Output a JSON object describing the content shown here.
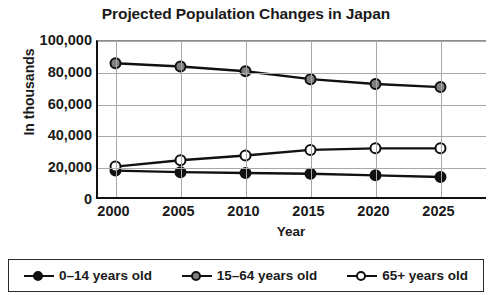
{
  "chart_data": {
    "type": "line",
    "title": "Projected Population Changes in Japan",
    "xlabel": "Year",
    "ylabel": "In thousands",
    "categories": [
      "2000",
      "2005",
      "2010",
      "2015",
      "2020",
      "2025"
    ],
    "x": [
      2000,
      2005,
      2010,
      2015,
      2020,
      2025
    ],
    "ylim": [
      0,
      100000
    ],
    "ytick_labels": [
      "0",
      "20,000",
      "40,000",
      "60,000",
      "80,000",
      "100,000"
    ],
    "ytick_values": [
      0,
      20000,
      40000,
      60000,
      80000,
      100000
    ],
    "grid": true,
    "legend_position": "bottom",
    "series": [
      {
        "name": "0–14 years old",
        "marker": "filled-circle",
        "color": "#111111",
        "fill": "#111111",
        "values": [
          18500,
          17500,
          17000,
          16500,
          15500,
          14500
        ]
      },
      {
        "name": "15–64 years old",
        "marker": "gray-circle",
        "color": "#111111",
        "fill": "#808080",
        "values": [
          86000,
          84000,
          81000,
          76000,
          73000,
          71000
        ]
      },
      {
        "name": "65+ years old",
        "marker": "open-circle",
        "color": "#111111",
        "fill": "#ffffff",
        "values": [
          21000,
          25000,
          28000,
          31500,
          32500,
          32500
        ]
      }
    ]
  },
  "legend": {
    "items": [
      {
        "label": "0–14 years old"
      },
      {
        "label": "15–64 years old"
      },
      {
        "label": "65+ years old"
      }
    ]
  }
}
